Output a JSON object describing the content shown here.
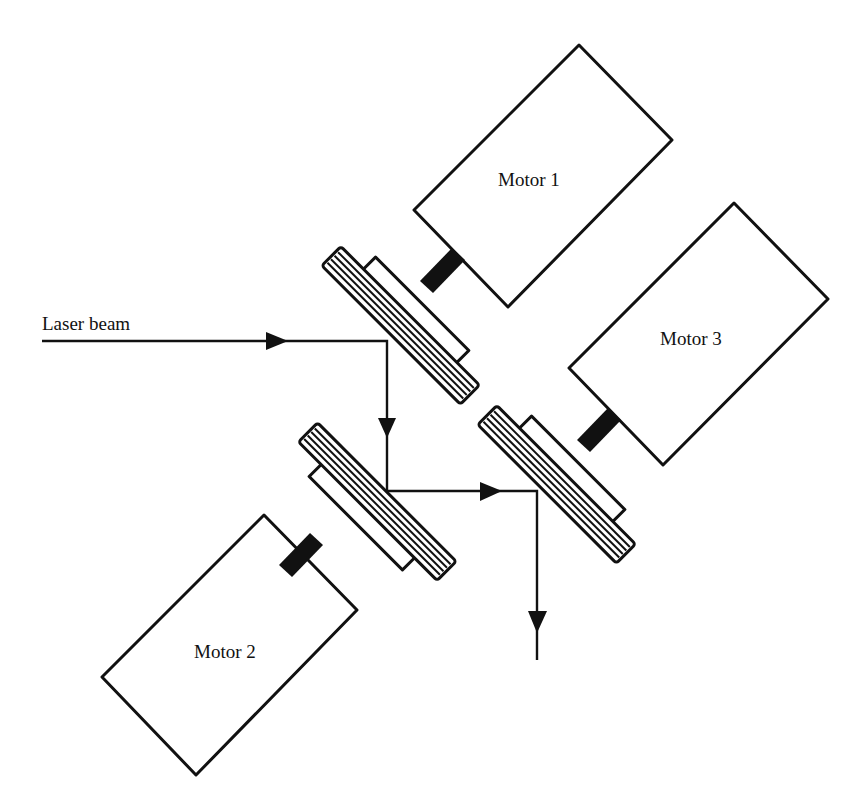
{
  "diagram": {
    "type": "optical-scanner-schematic",
    "labels": {
      "laser": "Laser beam",
      "motor1": "Motor 1",
      "motor2": "Motor 2",
      "motor3": "Motor 3"
    },
    "components": [
      {
        "id": "motor1",
        "label": "Motor 1",
        "kind": "motor"
      },
      {
        "id": "motor2",
        "label": "Motor 2",
        "kind": "motor"
      },
      {
        "id": "motor3",
        "label": "Motor 3",
        "kind": "motor"
      },
      {
        "id": "mirror1",
        "kind": "mirror",
        "driven_by": "motor1"
      },
      {
        "id": "mirror2",
        "kind": "mirror",
        "driven_by": "motor2"
      },
      {
        "id": "mirror3",
        "kind": "mirror",
        "driven_by": "motor3"
      }
    ],
    "beam_path": [
      "laser source",
      "mirror1",
      "mirror2",
      "mirror3",
      "output"
    ],
    "colors": {
      "ink": "#111111",
      "background": "#ffffff"
    }
  }
}
